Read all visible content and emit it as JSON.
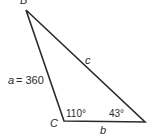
{
  "diagram": {
    "type": "triangle",
    "vertices": {
      "B": {
        "label": "B",
        "x": 26,
        "y": 10
      },
      "C": {
        "label": "C",
        "x": 64,
        "y": 121
      },
      "A": {
        "x": 145,
        "y": 122
      }
    },
    "sides": {
      "a": {
        "label": "a",
        "value_text": "= 360"
      },
      "b": {
        "label": "b"
      },
      "c": {
        "label": "c"
      }
    },
    "angles": {
      "C": {
        "text": "110°"
      },
      "A": {
        "text": "43°"
      }
    },
    "colors": {
      "line": "#2a2a2a",
      "background": "#ffffff"
    }
  }
}
